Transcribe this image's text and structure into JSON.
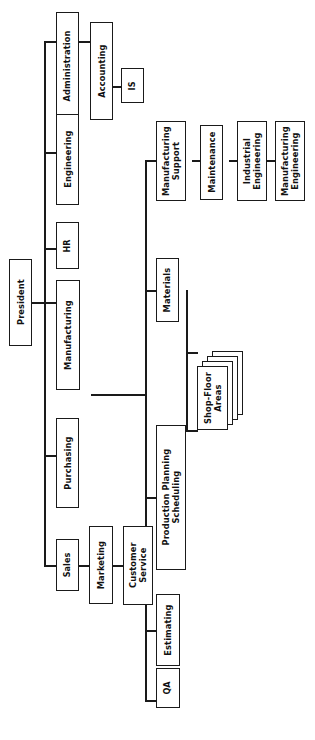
{
  "chart": {
    "orientation": "rotated-90",
    "line_color": "#1a1a1a",
    "box_fill": "#ffffff"
  },
  "nodes": {
    "president": "President",
    "administration": "Administration",
    "accounting": "Accounting",
    "is": "IS",
    "engineering": "Engineering",
    "hr": "HR",
    "manufacturing": "Manufacturing",
    "purchasing": "Purchasing",
    "sales": "Sales",
    "marketing": "Marketing",
    "customer_service": "Customer\nService",
    "manufacturing_support": "Manufacturing\nSupport",
    "maintenance": "Maintenance",
    "industrial_engineering": "Industrial\nEngineering",
    "manufacturing_engineering": "Manufacturing\nEngineering",
    "materials": "Materials",
    "production_planning": "Production Planning\nScheduling",
    "shop_floor_areas": "Shop-Floor\nAreas",
    "estimating": "Estimating",
    "qa": "QA"
  },
  "hierarchy": {
    "root": "President",
    "children": [
      {
        "name": "Administration",
        "children": [
          {
            "name": "Accounting",
            "children": [
              {
                "name": "IS",
                "children": []
              }
            ]
          }
        ]
      },
      {
        "name": "Engineering",
        "children": []
      },
      {
        "name": "HR",
        "children": []
      },
      {
        "name": "Manufacturing",
        "children": [
          {
            "name": "Manufacturing Support",
            "children": [
              {
                "name": "Maintenance",
                "children": [
                  {
                    "name": "Industrial Engineering",
                    "children": [
                      {
                        "name": "Manufacturing Engineering",
                        "children": []
                      }
                    ]
                  }
                ]
              }
            ]
          },
          {
            "name": "Materials",
            "children": [
              {
                "name": "Shop-Floor Areas",
                "children": []
              }
            ]
          },
          {
            "name": "Production Planning Scheduling",
            "children": [
              {
                "name": "Shop-Floor Areas",
                "children": []
              }
            ]
          },
          {
            "name": "Estimating",
            "children": []
          },
          {
            "name": "QA",
            "children": []
          }
        ]
      },
      {
        "name": "Purchasing",
        "children": []
      },
      {
        "name": "Sales",
        "children": [
          {
            "name": "Marketing",
            "children": [
              {
                "name": "Customer Service",
                "children": []
              }
            ]
          }
        ]
      }
    ]
  }
}
